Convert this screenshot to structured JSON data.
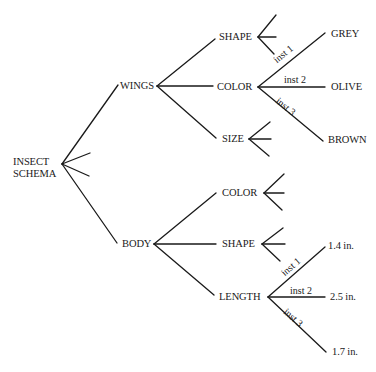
{
  "root": {
    "label_line1": "INSECT",
    "label_line2": "SCHEMA"
  },
  "wings": {
    "label": "WINGS",
    "shape": {
      "label": "SHAPE"
    },
    "color": {
      "label": "COLOR",
      "instances": [
        {
          "inst_label": "inst 1",
          "value": "GREY"
        },
        {
          "inst_label": "inst 2",
          "value": "OLIVE"
        },
        {
          "inst_label": "inst 3",
          "value": "BROWN"
        }
      ]
    },
    "size": {
      "label": "SIZE"
    }
  },
  "body": {
    "label": "BODY",
    "color": {
      "label": "COLOR"
    },
    "shape": {
      "label": "SHAPE"
    },
    "length": {
      "label": "LENGTH",
      "instances": [
        {
          "inst_label": "inst 1",
          "value": "1.4 in."
        },
        {
          "inst_label": "inst 2",
          "value": "2.5 in."
        },
        {
          "inst_label": "inst 3",
          "value": "1.7 in."
        }
      ]
    }
  }
}
